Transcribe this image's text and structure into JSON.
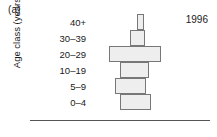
{
  "figure": {
    "panel_label": "(a)",
    "year_annotation": "1996",
    "y_axis_title": "Age class (years)"
  },
  "colors": {
    "bar_fill": "#eeeeee",
    "bar_stroke": "#777777",
    "axis_line": "#555555",
    "text": "#1a1a1a",
    "background": "#ffffff"
  },
  "chart_data": {
    "type": "bar",
    "orientation": "horizontal",
    "title": "",
    "subtitle": "",
    "xlabel": "",
    "ylabel": "Age class (years)",
    "annotations": [
      "(a)",
      "1996"
    ],
    "grid": false,
    "legend": null,
    "categories": [
      "40+",
      "30–39",
      "20–29",
      "10–19",
      "5–9",
      "0–4"
    ],
    "values": [
      6,
      13,
      43,
      24,
      26,
      26
    ],
    "bar_starts": [
      39,
      33,
      16,
      25,
      21,
      25
    ],
    "xlim": [
      0,
      100
    ],
    "ylim": null,
    "note": "Bars are horizontal, offset-staggered; values are bar lengths and bar_starts are left-edge offsets in percent of plot width."
  },
  "axis": {
    "tick_labels": [
      "40+",
      "30–39",
      "20–29",
      "10–19",
      "5–9",
      "0–4"
    ]
  }
}
